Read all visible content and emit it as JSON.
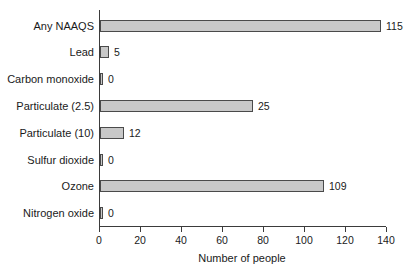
{
  "chart_data": {
    "type": "bar",
    "orientation": "horizontal",
    "title": "",
    "xlabel": "Number of people",
    "ylabel": "",
    "xlim": [
      0,
      140
    ],
    "xticks": [
      0,
      20,
      40,
      60,
      80,
      100,
      120,
      140
    ],
    "xtick_labels": [
      "0",
      "20",
      "40",
      "60",
      "80",
      "100",
      "120",
      "140"
    ],
    "grid": false,
    "legend": null,
    "bar_color": "#c8c8c8",
    "bar_edge_color": "#4a4a4a",
    "categories": [
      "Any NAAQS",
      "Lead",
      "Carbon monoxide",
      "Particulate (2.5)",
      "Particulate (10)",
      "Sulfur dioxide",
      "Ozone",
      "Nitrogen oxide"
    ],
    "values": [
      115,
      5,
      0,
      25,
      12,
      0,
      109,
      0
    ],
    "value_labels": [
      "115",
      "5",
      "0",
      "25",
      "12",
      "0",
      "109",
      "0"
    ],
    "bar_pixel_lengths": [
      281,
      9,
      3,
      153,
      24,
      3,
      224,
      3
    ]
  },
  "axis": {
    "x_title": "Number of people"
  }
}
